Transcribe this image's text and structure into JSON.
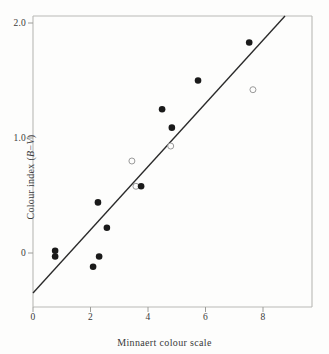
{
  "chart_data": {
    "type": "scatter",
    "title": "",
    "xlabel": "Minnaert colour scale",
    "ylabel": "Colour index (B−V)",
    "xlim": [
      -0.6,
      9.7
    ],
    "ylim": [
      -0.6,
      2.2
    ],
    "xticks": [
      0,
      2,
      4,
      6,
      8
    ],
    "xticklabels": [
      "0",
      "2",
      "4",
      "6",
      "8"
    ],
    "yticks": [
      0,
      1.0,
      2.0
    ],
    "yticklabels": [
      "0",
      "1.0",
      "2.0"
    ],
    "grid": false,
    "legend": null,
    "series": [
      {
        "name": "filled-points",
        "marker": "filled-circle",
        "color": "#1a1a1a",
        "points": [
          {
            "x": 0.77,
            "y": 0.02
          },
          {
            "x": 0.77,
            "y": -0.03
          },
          {
            "x": 2.09,
            "y": -0.12
          },
          {
            "x": 2.26,
            "y": 0.44
          },
          {
            "x": 2.3,
            "y": -0.03
          },
          {
            "x": 2.57,
            "y": 0.22
          },
          {
            "x": 3.76,
            "y": 0.58
          },
          {
            "x": 4.49,
            "y": 1.25
          },
          {
            "x": 4.83,
            "y": 1.09
          },
          {
            "x": 5.74,
            "y": 1.5
          },
          {
            "x": 7.52,
            "y": 1.83
          }
        ]
      },
      {
        "name": "open-points",
        "marker": "open-circle",
        "color": "#8a8a8a",
        "points": [
          {
            "x": 3.44,
            "y": 0.8
          },
          {
            "x": 3.58,
            "y": 0.58
          },
          {
            "x": 4.79,
            "y": 0.93
          },
          {
            "x": 7.65,
            "y": 1.42
          }
        ]
      }
    ],
    "fit_line": {
      "name": "regression-line",
      "color": "#2a2a2a",
      "x_start": 0.0,
      "y_start": -0.35,
      "x_end": 8.78,
      "y_end": 2.12
    }
  },
  "axes": {
    "x_title": "Minnaert colour scale",
    "y_title_prefix": "Colour index (",
    "y_title_italic_b": "B",
    "y_title_minus": "−",
    "y_title_italic_v": "V",
    "y_title_suffix": ")",
    "x_tick_labels": [
      "0",
      "2",
      "4",
      "6",
      "8"
    ],
    "y_tick_labels": [
      "2.0",
      "1.0",
      "0"
    ]
  },
  "colors": {
    "background": "#fdfdfc",
    "frame": "#b9b9b5",
    "marker_filled": "#1a1a1a",
    "marker_open_stroke": "#9a9a9a",
    "line": "#2a2a2a",
    "text": "#3a3a3a"
  }
}
